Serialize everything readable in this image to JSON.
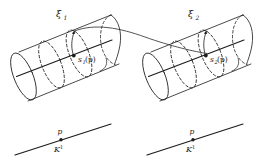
{
  "figure": {
    "background_color": "#ffffff",
    "ink_color": "#1c1c1c"
  },
  "bundles": [
    {
      "id": "left",
      "bundle_label": "ξ",
      "bundle_sub": "1",
      "section_label": "s",
      "section_sub": "1",
      "section_arg": "(p)",
      "base_point_label": "p",
      "base_space_label": "K",
      "base_space_sup": "1"
    },
    {
      "id": "right",
      "bundle_label": "ξ",
      "bundle_sub": "2",
      "section_label": "s",
      "section_sub": "2",
      "section_arg": "(p)",
      "base_point_label": "p",
      "base_space_label": "K",
      "base_space_sup": "1"
    }
  ],
  "connector": {
    "name": "bundle-map-arc",
    "description": "curved arc linking left bundle total space to right bundle total space"
  }
}
